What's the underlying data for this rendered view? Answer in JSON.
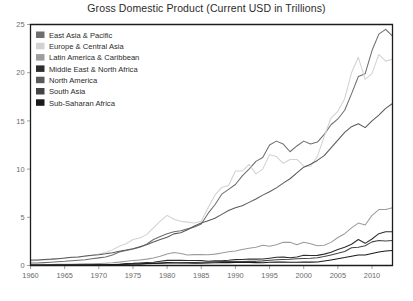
{
  "chart_data": {
    "type": "line",
    "title": "Gross Domestic Product (Current USD in Trillions)",
    "xlabel": "",
    "ylabel": "",
    "xlim": [
      1960,
      2013
    ],
    "ylim": [
      0,
      25
    ],
    "xticks": [
      1960,
      1965,
      1970,
      1975,
      1980,
      1985,
      1990,
      1995,
      2000,
      2005,
      2010
    ],
    "yticks": [
      0,
      5,
      10,
      15,
      20,
      25
    ],
    "grid": false,
    "legend_position": "top-left-inside",
    "x": [
      1960,
      1961,
      1962,
      1963,
      1964,
      1965,
      1966,
      1967,
      1968,
      1969,
      1970,
      1971,
      1972,
      1973,
      1974,
      1975,
      1976,
      1977,
      1978,
      1979,
      1980,
      1981,
      1982,
      1983,
      1984,
      1985,
      1986,
      1987,
      1988,
      1989,
      1990,
      1991,
      1992,
      1993,
      1994,
      1995,
      1996,
      1997,
      1998,
      1999,
      2000,
      2001,
      2002,
      2003,
      2004,
      2005,
      2006,
      2007,
      2008,
      2009,
      2010,
      2011,
      2012,
      2013
    ],
    "series": [
      {
        "name": "East Asia & Pacific",
        "color": "#6e6e6e",
        "values": [
          0.26,
          0.27,
          0.3,
          0.34,
          0.39,
          0.43,
          0.49,
          0.54,
          0.6,
          0.69,
          0.79,
          0.89,
          1.1,
          1.4,
          1.55,
          1.7,
          1.9,
          2.2,
          2.7,
          3.0,
          3.3,
          3.5,
          3.6,
          3.8,
          4.0,
          4.3,
          5.4,
          6.3,
          7.4,
          7.9,
          8.4,
          9.3,
          10.0,
          10.8,
          11.2,
          12.5,
          12.9,
          12.6,
          11.8,
          12.4,
          12.9,
          12.6,
          12.8,
          13.6,
          14.6,
          15.2,
          16.1,
          17.8,
          19.6,
          19.9,
          22.3,
          24.0,
          24.5,
          23.8
        ]
      },
      {
        "name": "Europe & Central Asia",
        "color": "#d2d2d2",
        "values": [
          0.47,
          0.51,
          0.56,
          0.62,
          0.69,
          0.75,
          0.82,
          0.88,
          0.93,
          1.04,
          1.2,
          1.36,
          1.62,
          2.0,
          2.25,
          2.7,
          2.85,
          3.2,
          3.9,
          4.6,
          5.2,
          4.8,
          4.6,
          4.5,
          4.4,
          4.6,
          6.0,
          7.3,
          8.1,
          8.3,
          9.8,
          9.8,
          10.5,
          9.5,
          10.0,
          11.5,
          11.3,
          10.6,
          11.0,
          11.0,
          10.3,
          10.3,
          11.3,
          13.4,
          15.3,
          16.0,
          17.3,
          20.0,
          21.6,
          19.3,
          19.9,
          21.9,
          21.2,
          21.4
        ]
      },
      {
        "name": "Latin America & Caribbean",
        "color": "#9c9c9c",
        "values": [
          0.08,
          0.09,
          0.09,
          0.1,
          0.12,
          0.13,
          0.14,
          0.15,
          0.17,
          0.19,
          0.21,
          0.24,
          0.28,
          0.35,
          0.45,
          0.51,
          0.58,
          0.66,
          0.77,
          0.96,
          1.2,
          1.35,
          1.25,
          1.1,
          1.13,
          1.15,
          1.12,
          1.18,
          1.3,
          1.42,
          1.5,
          1.65,
          1.8,
          1.9,
          2.1,
          2.0,
          2.15,
          2.4,
          2.4,
          2.15,
          2.4,
          2.25,
          2.05,
          2.1,
          2.4,
          2.9,
          3.3,
          3.9,
          4.4,
          4.2,
          5.2,
          5.8,
          5.8,
          6.0
        ]
      },
      {
        "name": "Middle East & North Africa",
        "color": "#2d2d2d",
        "values": [
          0.02,
          0.02,
          0.02,
          0.02,
          0.03,
          0.03,
          0.03,
          0.04,
          0.04,
          0.05,
          0.05,
          0.07,
          0.08,
          0.11,
          0.2,
          0.22,
          0.27,
          0.31,
          0.33,
          0.43,
          0.53,
          0.55,
          0.53,
          0.52,
          0.52,
          0.51,
          0.45,
          0.48,
          0.5,
          0.54,
          0.63,
          0.63,
          0.67,
          0.66,
          0.68,
          0.76,
          0.85,
          0.87,
          0.8,
          0.89,
          1.06,
          1.03,
          1.05,
          1.18,
          1.38,
          1.66,
          1.89,
          2.2,
          2.7,
          2.3,
          2.75,
          3.3,
          3.5,
          3.5
        ]
      },
      {
        "name": "North America",
        "color": "#5a5a5a",
        "values": [
          0.56,
          0.58,
          0.63,
          0.66,
          0.71,
          0.77,
          0.85,
          0.89,
          0.98,
          1.06,
          1.11,
          1.21,
          1.33,
          1.48,
          1.6,
          1.74,
          1.95,
          2.16,
          2.43,
          2.7,
          2.93,
          3.28,
          3.4,
          3.7,
          4.1,
          4.4,
          4.65,
          4.9,
          5.3,
          5.7,
          6.0,
          6.2,
          6.55,
          6.9,
          7.3,
          7.65,
          8.05,
          8.55,
          9.0,
          9.6,
          10.2,
          10.5,
          10.9,
          11.4,
          12.2,
          13.0,
          13.8,
          14.4,
          14.7,
          14.3,
          15.0,
          15.6,
          16.3,
          16.8
        ]
      },
      {
        "name": "South Asia",
        "color": "#444444",
        "values": [
          0.05,
          0.05,
          0.05,
          0.06,
          0.07,
          0.07,
          0.07,
          0.08,
          0.08,
          0.09,
          0.1,
          0.1,
          0.1,
          0.12,
          0.14,
          0.15,
          0.15,
          0.18,
          0.2,
          0.22,
          0.25,
          0.27,
          0.28,
          0.3,
          0.3,
          0.33,
          0.35,
          0.38,
          0.41,
          0.41,
          0.44,
          0.4,
          0.43,
          0.43,
          0.48,
          0.55,
          0.6,
          0.63,
          0.65,
          0.7,
          0.73,
          0.75,
          0.8,
          0.93,
          1.1,
          1.27,
          1.46,
          1.85,
          1.9,
          2.05,
          2.45,
          2.6,
          2.55,
          2.6
        ]
      },
      {
        "name": "Sub-Saharan Africa",
        "color": "#1a1a1a",
        "values": [
          0.03,
          0.03,
          0.03,
          0.04,
          0.04,
          0.05,
          0.05,
          0.05,
          0.05,
          0.06,
          0.07,
          0.08,
          0.09,
          0.11,
          0.14,
          0.16,
          0.17,
          0.2,
          0.22,
          0.26,
          0.3,
          0.29,
          0.27,
          0.25,
          0.24,
          0.23,
          0.25,
          0.28,
          0.3,
          0.3,
          0.32,
          0.32,
          0.32,
          0.3,
          0.29,
          0.33,
          0.35,
          0.36,
          0.34,
          0.34,
          0.36,
          0.35,
          0.37,
          0.47,
          0.58,
          0.7,
          0.82,
          0.96,
          1.1,
          1.08,
          1.25,
          1.4,
          1.5,
          1.55
        ]
      }
    ]
  },
  "axis": {
    "y_labels": [
      "25",
      "20",
      "15",
      "10",
      "5",
      "0"
    ],
    "x_labels": [
      "1960",
      "1965",
      "1970",
      "1975",
      "1980",
      "1985",
      "1990",
      "1995",
      "2000",
      "2005",
      "2010"
    ]
  },
  "legend": {
    "items": [
      {
        "label": "East Asia & Pacific",
        "color": "#6e6e6e"
      },
      {
        "label": "Europe & Central Asia",
        "color": "#d2d2d2"
      },
      {
        "label": "Latin America & Caribbean",
        "color": "#9c9c9c"
      },
      {
        "label": "Middle East & North Africa",
        "color": "#2d2d2d"
      },
      {
        "label": "North America",
        "color": "#5a5a5a"
      },
      {
        "label": "South Asia",
        "color": "#444444"
      },
      {
        "label": "Sub-Saharan Africa",
        "color": "#1a1a1a"
      }
    ]
  }
}
